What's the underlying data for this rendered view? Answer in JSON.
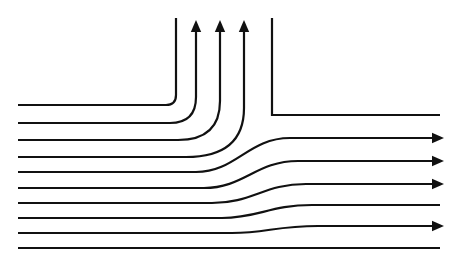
{
  "figure": {
    "title": "Streamline pattern for flow through a branching duct (T-junction)",
    "width": 457,
    "height": 267,
    "background_color": "#ffffff",
    "line_color": "#111111",
    "line_width": 2.2,
    "wall_line_width": 2.2
  },
  "chart_data": {
    "type": "line",
    "title": "Streamline pattern for flow through a branching duct (T-junction)",
    "subtitle": "",
    "xlabel": "",
    "ylabel": "",
    "xlim": [
      0,
      457
    ],
    "ylim": [
      267,
      0
    ],
    "grid": false,
    "legend": null,
    "annotations": [],
    "series": [
      {
        "name": "wall-upper-left",
        "role": "wall",
        "arrow": "none",
        "path": "M 18 105 L 166 105 Q 176 105 176 95 L 176 18",
        "inlet_y": 105,
        "outlet": "top"
      },
      {
        "name": "streamline-1",
        "role": "streamline",
        "arrow": "up",
        "path": "M 18 123 L 170 123 Q 196 123 196 97 L 196 26",
        "inlet_y": 123,
        "outlet": "top",
        "arrow_x": 196,
        "arrow_y": 20
      },
      {
        "name": "streamline-2",
        "role": "streamline",
        "arrow": "up",
        "path": "M 18 140 L 178 140 Q 220 140 220 101 L 220 26",
        "inlet_y": 140,
        "outlet": "top",
        "arrow_x": 220,
        "arrow_y": 20
      },
      {
        "name": "streamline-3",
        "role": "streamline",
        "arrow": "up",
        "path": "M 18 157 L 186 157 Q 244 157 244 108 L 244 26",
        "inlet_y": 157,
        "outlet": "top",
        "arrow_x": 244,
        "arrow_y": 20
      },
      {
        "name": "wall-upper-right",
        "role": "wall",
        "arrow": "none",
        "path": "M 272 18 L 272 115 L 440 115",
        "inlet_y": null,
        "outlet": "right"
      },
      {
        "name": "streamline-4",
        "role": "streamline",
        "arrow": "right",
        "path": "M 18 172 L 196 172 C 236 172 248 138 290 138 L 434 138",
        "inlet_y": 172,
        "outlet": "right",
        "arrow_x": 444,
        "arrow_y": 138
      },
      {
        "name": "streamline-5",
        "role": "streamline",
        "arrow": "right",
        "path": "M 18 188 L 204 188 C 244 188 256 161 298 161 L 434 161",
        "inlet_y": 188,
        "outlet": "right",
        "arrow_x": 444,
        "arrow_y": 161
      },
      {
        "name": "streamline-6",
        "role": "streamline",
        "arrow": "right",
        "path": "M 18 203 L 212 203 C 252 203 264 184 306 184 L 434 184",
        "inlet_y": 203,
        "outlet": "right",
        "arrow_x": 444,
        "arrow_y": 184
      },
      {
        "name": "streamline-7",
        "role": "streamline",
        "arrow": "none",
        "path": "M 18 218 L 222 218 C 258 218 270 205 312 205 L 440 205",
        "inlet_y": 218,
        "outlet": "right"
      },
      {
        "name": "streamline-8",
        "role": "streamline",
        "arrow": "right",
        "path": "M 18 233 L 232 233 C 266 233 276 226 318 226 L 434 226",
        "inlet_y": 233,
        "outlet": "right",
        "arrow_x": 444,
        "arrow_y": 226
      },
      {
        "name": "wall-lower",
        "role": "wall",
        "arrow": "none",
        "path": "M 18 248 L 440 248",
        "inlet_y": 248,
        "outlet": "right"
      }
    ],
    "arrow_counts": {
      "up": 3,
      "right": 4,
      "none": 4
    },
    "total_lines": 10
  }
}
